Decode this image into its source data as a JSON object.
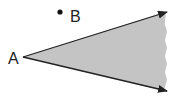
{
  "diagram": {
    "type": "angle-region",
    "labels": {
      "vertex": "A",
      "point": "B"
    },
    "colors": {
      "fill": "#c4c4c4",
      "stroke": "#222222",
      "background": "#ffffff"
    }
  }
}
